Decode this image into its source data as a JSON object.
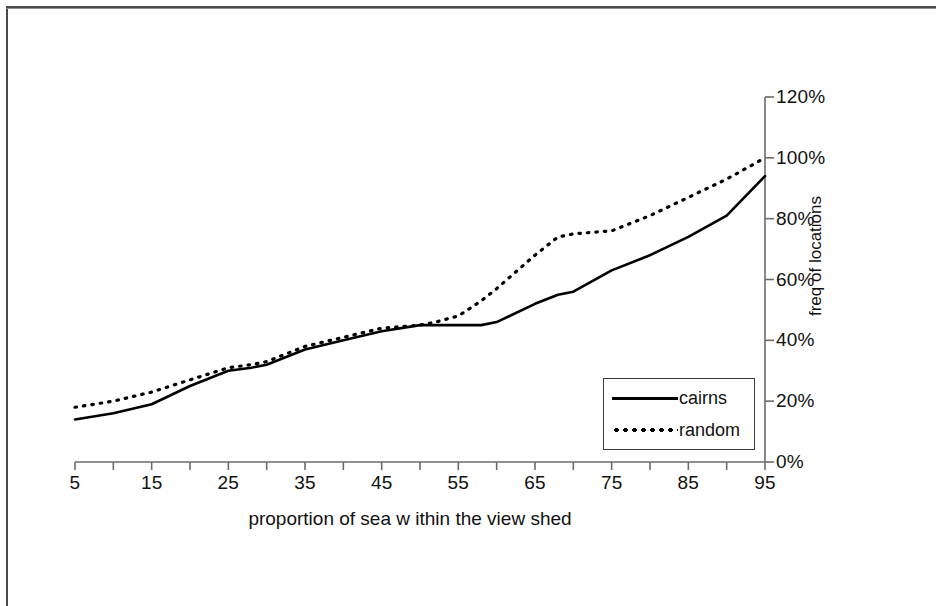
{
  "chart_data": {
    "type": "line",
    "title": "",
    "subtitle": "",
    "xlabel": "proportion of sea w ithin the view shed",
    "ylabel": "freq of locations",
    "x": [
      5,
      15,
      25,
      35,
      45,
      55,
      65,
      75,
      85,
      95
    ],
    "xlim": [
      5,
      95
    ],
    "ylim": [
      0,
      120
    ],
    "grid": false,
    "y_axis_position": "right",
    "x_tick_labels": [
      "5",
      "15",
      "25",
      "35",
      "45",
      "55",
      "65",
      "75",
      "85",
      "95"
    ],
    "y_tick_labels": [
      "0%",
      "20%",
      "40%",
      "60%",
      "80%",
      "100%",
      "120%"
    ],
    "y_tick_values": [
      0,
      20,
      40,
      60,
      80,
      100,
      120
    ],
    "minor_x_ticks": [
      10,
      20,
      30,
      40,
      50,
      60,
      70,
      80,
      90
    ],
    "legend_position": "bottom-right-inside",
    "series": [
      {
        "name": "cairns",
        "style": "solid",
        "color": "#000000",
        "values": [
          14,
          19,
          30,
          37,
          43,
          45,
          52,
          63,
          74,
          94
        ],
        "dense_x": [
          5,
          10,
          15,
          20,
          25,
          28,
          30,
          35,
          40,
          45,
          50,
          52,
          55,
          58,
          60,
          65,
          68,
          70,
          75,
          80,
          85,
          90,
          95
        ],
        "dense_y": [
          14,
          16,
          19,
          25,
          30,
          31,
          32,
          37,
          40,
          43,
          45,
          45,
          45,
          45,
          46,
          52,
          55,
          56,
          63,
          68,
          74,
          81,
          94
        ]
      },
      {
        "name": "random",
        "style": "dotted",
        "color": "#000000",
        "values": [
          18,
          23,
          31,
          38,
          44,
          48,
          68,
          76,
          87,
          100
        ],
        "dense_x": [
          5,
          10,
          15,
          20,
          25,
          28,
          30,
          35,
          40,
          45,
          50,
          52,
          55,
          58,
          60,
          65,
          68,
          70,
          75,
          80,
          85,
          90,
          95
        ],
        "dense_y": [
          18,
          20,
          23,
          27,
          31,
          32,
          33,
          38,
          41,
          44,
          45,
          46,
          48,
          53,
          57,
          68,
          74,
          75,
          76,
          81,
          87,
          93,
          100
        ]
      }
    ]
  },
  "legend": {
    "entries": [
      {
        "label": "cairns",
        "style": "solid"
      },
      {
        "label": "random",
        "style": "dotted"
      }
    ]
  },
  "axes": {
    "x_title": "proportion of sea w ithin the view shed",
    "y_title": "freq of locations"
  },
  "colors": {
    "line": "#000000",
    "axis": "#6b6b6b",
    "frame": "#4a4a4a",
    "text": "#111111",
    "background": "#ffffff"
  }
}
